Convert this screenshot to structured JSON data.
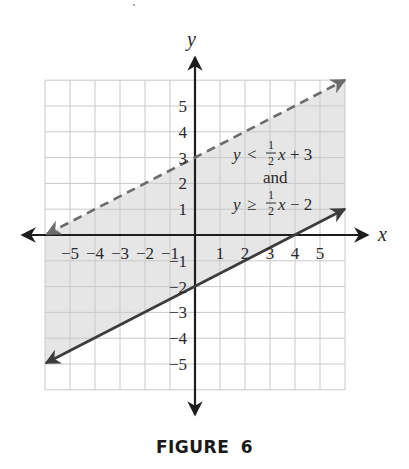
{
  "caption": "FIGURE  6",
  "chart_data": {
    "type": "line",
    "title": "",
    "caption": "FIGURE 6",
    "xlabel": "x",
    "ylabel": "y",
    "xlim": [
      -6,
      6
    ],
    "ylim": [
      -6,
      6
    ],
    "grid": true,
    "x_ticks": [
      -5,
      -4,
      -3,
      -2,
      -1,
      1,
      2,
      3,
      4,
      5
    ],
    "y_ticks": [
      5,
      4,
      3,
      2,
      1,
      -1,
      -2,
      -3,
      -4,
      -5
    ],
    "x_tick_labels": [
      "−5",
      "−4",
      "−3",
      "−2",
      "−1",
      "1",
      "2",
      "3",
      "4",
      "5"
    ],
    "y_tick_labels": [
      "5",
      "4",
      "3",
      "2",
      "1",
      "−1",
      "−2",
      "−3",
      "−4",
      "−5"
    ],
    "series": [
      {
        "name": "y = 1/2 x + 3",
        "style": "dashed",
        "color": "#6b6b6b",
        "x": [
          -6,
          6
        ],
        "y": [
          0,
          6
        ],
        "slope": 0.5,
        "intercept": 3,
        "inequality": "y < 1/2 x + 3"
      },
      {
        "name": "y = 1/2 x - 2",
        "style": "solid",
        "color": "#3c3c3c",
        "x": [
          -6,
          6
        ],
        "y": [
          -5,
          1
        ],
        "slope": 0.5,
        "intercept": -2,
        "inequality": "y ≥ 1/2 x − 2"
      }
    ],
    "shaded_region": {
      "description": "region between the two lines",
      "color": "#e6e6e6",
      "lower_bound": "y = 1/2 x - 2 (included)",
      "upper_bound": "y = 1/2 x + 3 (excluded)"
    },
    "annotations": [
      {
        "text": "y < ½x + 3",
        "x": 3,
        "y": 3.2
      },
      {
        "text": "and",
        "x": 3,
        "y": 2.2
      },
      {
        "text": "y ≥ ½x − 2",
        "x": 3,
        "y": 1.2
      }
    ]
  },
  "labels": {
    "x_axis": "x",
    "y_axis": "y",
    "ann_line1_y": "y",
    "ann_line1_op": "<",
    "ann_line1_tail_x": "x",
    "ann_line1_tail_rest": "+ 3",
    "ann_and": "and",
    "ann_line2_y": "y",
    "ann_line2_op": "≥",
    "ann_line2_tail_x": "x",
    "ann_line2_tail_rest": "− 2",
    "frac_num": "1",
    "frac_den": "2"
  },
  "colors": {
    "grid": "#c9c9c9",
    "axis": "#1e1e1e",
    "shade": "#e6e6e6",
    "dashed_line": "#6b6b6b",
    "solid_line": "#3c3c3c"
  }
}
